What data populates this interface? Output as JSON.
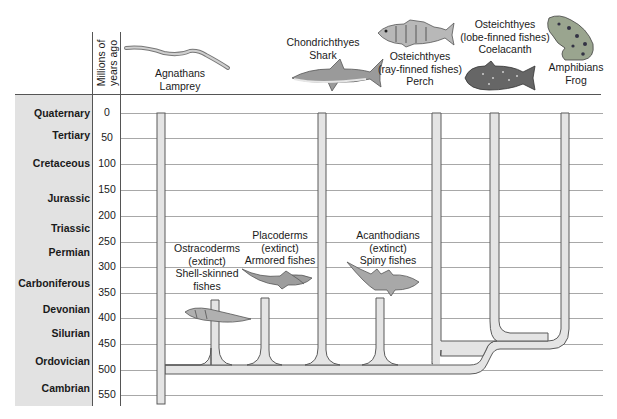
{
  "header": {
    "axis_label_line1": "Millions of",
    "axis_label_line2": "years ago"
  },
  "periods": [
    {
      "name": "Quaternary",
      "top": 107
    },
    {
      "name": "Tertiary",
      "top": 129
    },
    {
      "name": "Cretaceous",
      "top": 157
    },
    {
      "name": "Jurassic",
      "top": 192
    },
    {
      "name": "Triassic",
      "top": 222
    },
    {
      "name": "Permian",
      "top": 246
    },
    {
      "name": "Carboniferous",
      "top": 277
    },
    {
      "name": "Devonian",
      "top": 303
    },
    {
      "name": "Silurian",
      "top": 327
    },
    {
      "name": "Ordovician",
      "top": 355
    },
    {
      "name": "Cambrian",
      "top": 382
    }
  ],
  "ticks": [
    {
      "label": "0",
      "y": 113
    },
    {
      "label": "50",
      "y": 138
    },
    {
      "label": "100",
      "y": 164
    },
    {
      "label": "150",
      "y": 190
    },
    {
      "label": "200",
      "y": 216
    },
    {
      "label": "250",
      "y": 242
    },
    {
      "label": "300",
      "y": 267
    },
    {
      "label": "350",
      "y": 293
    },
    {
      "label": "400",
      "y": 318
    },
    {
      "label": "450",
      "y": 344
    },
    {
      "label": "500",
      "y": 370
    },
    {
      "label": "550",
      "y": 395
    }
  ],
  "groups": {
    "agnathans": {
      "line1": "Agnathans",
      "line2": "Lamprey",
      "icon": "lamprey-icon"
    },
    "chondrichthyes": {
      "line1": "Chondrichthyes",
      "line2": "Shark",
      "icon": "shark-icon"
    },
    "ray_finned": {
      "line1": "Osteichthyes",
      "line2": "(ray-finned fishes)",
      "line3": "Perch",
      "icon": "perch-icon"
    },
    "lobe_finned": {
      "line1": "Osteichthyes",
      "line2": "(lobe-finned fishes)",
      "line3": "Coelacanth",
      "icon": "coelacanth-icon"
    },
    "amphibians": {
      "line1": "Amphibians",
      "line2": "Frog",
      "icon": "frog-icon"
    },
    "ostracoderms": {
      "line1": "Ostracoderms",
      "line2": "(extinct)",
      "line3": "Shell-skinned",
      "line4": "fishes",
      "icon": "ostracoderm-icon"
    },
    "placoderms": {
      "line1": "Placoderms",
      "line2": "(extinct)",
      "line3": "Armored fishes",
      "icon": "placoderm-icon"
    },
    "acanthodians": {
      "line1": "Acanthodians",
      "line2": "(extinct)",
      "line3": "Spiny fishes",
      "icon": "acanthodian-icon"
    }
  },
  "colors": {
    "branch_fill": "#e4e4e4",
    "branch_stroke": "#5a5a5a",
    "period_band": "#e2e2e2",
    "grid": "#a8a8a8"
  }
}
